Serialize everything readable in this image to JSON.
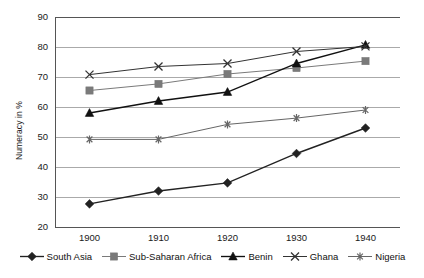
{
  "chart_data": {
    "type": "line",
    "title": "",
    "xlabel": "",
    "ylabel": "Numeracy in %",
    "categories": [
      "1900",
      "1910",
      "1920",
      "1930",
      "1940"
    ],
    "x": [
      1900,
      1910,
      1920,
      1930,
      1940
    ],
    "xlim": [
      1895,
      1945
    ],
    "ylim": [
      20,
      90
    ],
    "yticks": [
      "20",
      "30",
      "40",
      "50",
      "60",
      "70",
      "80",
      "90"
    ],
    "ytick_values": [
      20,
      30,
      40,
      50,
      60,
      70,
      80,
      90
    ],
    "grid": true,
    "legend_position": "bottom",
    "series": [
      {
        "name": "South Asia",
        "marker": "diamond",
        "color": "#222222",
        "values": [
          27.7,
          32.0,
          34.7,
          44.5,
          53.0
        ]
      },
      {
        "name": "Sub-Saharan Africa",
        "marker": "square",
        "color": "#7a7a7a",
        "values": [
          65.5,
          67.7,
          71.0,
          73.0,
          75.3
        ]
      },
      {
        "name": "Benin",
        "marker": "triangle",
        "color": "#111111",
        "values": [
          58.0,
          62.0,
          65.0,
          74.5,
          80.7
        ]
      },
      {
        "name": "Ghana",
        "marker": "cross",
        "color": "#333333",
        "values": [
          70.8,
          73.5,
          74.5,
          78.5,
          80.2
        ]
      },
      {
        "name": "Nigeria",
        "marker": "asterisk",
        "color": "#666666",
        "values": [
          49.2,
          49.2,
          54.2,
          56.3,
          59.0
        ]
      }
    ]
  },
  "axes": {
    "ylabel": "Numeracy in %"
  }
}
